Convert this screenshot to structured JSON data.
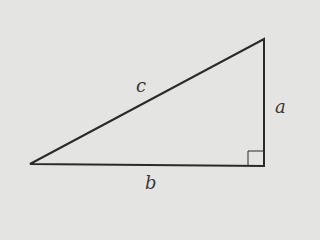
{
  "diagram": {
    "type": "right-triangle",
    "labels": {
      "hypotenuse": "c",
      "vertical_leg": "a",
      "horizontal_leg": "b"
    },
    "colors": {
      "background": "#e4e4e2",
      "stroke": "#2a2a2a",
      "label": "#3a3a3a"
    },
    "right_angle_marker": true
  }
}
